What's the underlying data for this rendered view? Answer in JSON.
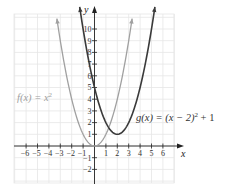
{
  "chart_data": {
    "type": "line",
    "title": "",
    "xlabel": "x",
    "ylabel": "y",
    "xlim": [
      -7,
      7
    ],
    "ylim": [
      -3,
      11
    ],
    "grid": true,
    "x_ticks": [
      "-6",
      "-5",
      "-4",
      "-3",
      "-2",
      "-1",
      "1",
      "2",
      "3",
      "4",
      "5",
      "6"
    ],
    "y_ticks": [
      "-2",
      "-1",
      "1",
      "2",
      "3",
      "4",
      "5",
      "6",
      "7",
      "8",
      "9",
      "10"
    ],
    "series": [
      {
        "name": "f(x) = x^2",
        "label_main": "f(x) = x",
        "label_sup": "2",
        "color": "#a0a0a0",
        "x": [
          -3.3,
          -3,
          -2,
          -1,
          0,
          1,
          2,
          3,
          3.3
        ],
        "values": [
          10.89,
          9,
          4,
          1,
          0,
          1,
          4,
          9,
          10.89
        ]
      },
      {
        "name": "g(x) = (x - 2)^2 + 1",
        "label_main": "g(x) = (x − 2)",
        "label_sup": "2",
        "label_tail": " + 1",
        "color": "#3a3a3a",
        "x": [
          -1.3,
          -1,
          0,
          1,
          2,
          3,
          4,
          5,
          5.3
        ],
        "values": [
          11.89,
          10,
          5,
          2,
          1,
          2,
          5,
          10,
          11.89
        ]
      }
    ]
  }
}
